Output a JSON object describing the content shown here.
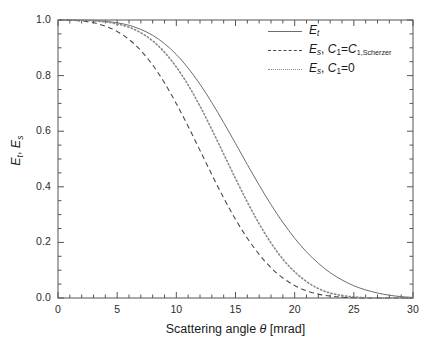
{
  "chart_data": {
    "type": "line",
    "title": "",
    "xlabel": "Scattering angle θ [mrad]",
    "ylabel": "E_t, E_s",
    "xlim": [
      0,
      30
    ],
    "ylim": [
      0,
      1
    ],
    "grid": false,
    "legend_position": "top-right",
    "xticks": [
      "0",
      "5",
      "10",
      "15",
      "20",
      "25",
      "30"
    ],
    "yticks": [
      "0.0",
      "0.2",
      "0.4",
      "0.6",
      "0.8",
      "1.0"
    ],
    "x": [
      0,
      1,
      2,
      3,
      4,
      5,
      6,
      7,
      8,
      9,
      10,
      11,
      12,
      13,
      14,
      15,
      16,
      17,
      18,
      19,
      20,
      21,
      22,
      23,
      24,
      25,
      26,
      27,
      28,
      29,
      30
    ],
    "series": [
      {
        "name": "E_t",
        "style": "solid",
        "color": "#6d6d6d",
        "values": [
          1.0,
          1.0,
          0.999,
          0.998,
          0.995,
          0.99,
          0.981,
          0.966,
          0.945,
          0.915,
          0.876,
          0.827,
          0.769,
          0.703,
          0.631,
          0.556,
          0.48,
          0.406,
          0.336,
          0.272,
          0.215,
          0.166,
          0.125,
          0.091,
          0.065,
          0.044,
          0.029,
          0.018,
          0.01,
          0.005,
          0.002
        ]
      },
      {
        "name": "E_s, C_1=C_1,Scherzer",
        "style": "dashed",
        "color": "#4a4a4a",
        "values": [
          1.0,
          0.999,
          0.996,
          0.99,
          0.978,
          0.959,
          0.93,
          0.89,
          0.838,
          0.774,
          0.699,
          0.617,
          0.531,
          0.444,
          0.36,
          0.283,
          0.215,
          0.157,
          0.109,
          0.072,
          0.045,
          0.026,
          0.014,
          0.007,
          0.003,
          0.001,
          0.0,
          0.0,
          0.0,
          0.0,
          0.0
        ]
      },
      {
        "name": "E_s, C_1=0",
        "style": "dotted",
        "color": "#8a8a8a",
        "values": [
          1.0,
          1.0,
          0.999,
          0.997,
          0.993,
          0.986,
          0.974,
          0.954,
          0.925,
          0.884,
          0.831,
          0.766,
          0.69,
          0.606,
          0.518,
          0.43,
          0.345,
          0.267,
          0.198,
          0.14,
          0.094,
          0.059,
          0.034,
          0.018,
          0.009,
          0.004,
          0.001,
          0.0,
          0.0,
          0.0,
          0.0
        ]
      }
    ]
  },
  "axes": {
    "x_title_prefix": "Scattering angle ",
    "x_title_symbol": "θ",
    "x_title_suffix": " [mrad]",
    "y_title_e1": "E",
    "y_title_sub1": "t",
    "y_title_sep": ", ",
    "y_title_e2": "E",
    "y_title_sub2": "s"
  },
  "legend": {
    "entries": [
      {
        "style": "solid",
        "base": "E",
        "sub": "t",
        "tail": ""
      },
      {
        "style": "dashed",
        "base": "E",
        "sub": "s",
        "tail": ", C₁=C₁,Scherzer"
      },
      {
        "style": "dotted",
        "base": "E",
        "sub": "s",
        "tail": ", C₁=0"
      }
    ],
    "entry1_main": "E",
    "entry1_sub": "t",
    "entry2_main": "E",
    "entry2_sub": "s",
    "entry2_rest_a": ", ",
    "entry2_rest_c": "C",
    "entry2_rest_c_sub": "1",
    "entry2_rest_eq": "=",
    "entry2_rest_c2": "C",
    "entry2_rest_c2_sub": "1,Scherzer",
    "entry3_main": "E",
    "entry3_sub": "s",
    "entry3_rest_a": ", ",
    "entry3_rest_c": "C",
    "entry3_rest_c_sub": "1",
    "entry3_rest_eq": "=0"
  }
}
